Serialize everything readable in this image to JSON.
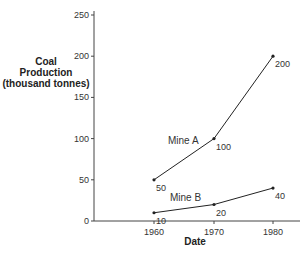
{
  "chart_data": {
    "type": "line",
    "title": "",
    "xlabel": "Date",
    "ylabel": "Coal Production (thousand tonnes)",
    "ylabel_lines": [
      "Coal",
      "Production",
      "(thousand tonnes)"
    ],
    "x": [
      1960,
      1970,
      1980
    ],
    "x_ticks": [
      "1960",
      "1970",
      "1980"
    ],
    "y_ticks": [
      "0",
      "50",
      "100",
      "150",
      "200",
      "250"
    ],
    "ylim": [
      0,
      250
    ],
    "grid": false,
    "legend": "inline labels",
    "series": [
      {
        "name": "Mine A",
        "values": [
          50,
          100,
          200
        ],
        "point_labels": [
          "50",
          "100",
          "200"
        ]
      },
      {
        "name": "Mine B",
        "values": [
          10,
          20,
          40
        ],
        "point_labels": [
          "10",
          "20",
          "40"
        ]
      }
    ]
  },
  "colors": {
    "line": "#222222",
    "axis": "#444444",
    "text": "#333333"
  }
}
